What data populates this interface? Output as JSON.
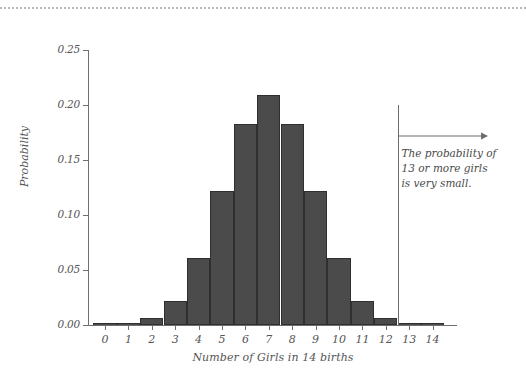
{
  "figure": {
    "top_rule": "dotted-rule"
  },
  "chart_data": {
    "type": "bar",
    "title": "",
    "subtitle": "",
    "xlabel": "Number of Girls in 14 births",
    "ylabel": "Probability",
    "categories": [
      "0",
      "1",
      "2",
      "3",
      "4",
      "5",
      "6",
      "7",
      "8",
      "9",
      "10",
      "11",
      "12",
      "13",
      "14"
    ],
    "values": [
      0.0,
      0.001,
      0.006,
      0.022,
      0.061,
      0.122,
      0.183,
      0.209,
      0.183,
      0.122,
      0.061,
      0.022,
      0.006,
      0.001,
      0.0
    ],
    "ylim": [
      0.0,
      0.25
    ],
    "xlim": [
      -0.5,
      14.5
    ],
    "ytick_labels": [
      "0.00",
      "0.05",
      "0.10",
      "0.15",
      "0.20",
      "0.25"
    ],
    "ytick_values": [
      0.0,
      0.05,
      0.1,
      0.15,
      0.2,
      0.25
    ],
    "xtick_labels": [
      "0",
      "1",
      "2",
      "3",
      "4",
      "5",
      "6",
      "7",
      "8",
      "9",
      "10",
      "11",
      "12",
      "13",
      "14"
    ],
    "grid": false,
    "legend": null,
    "bar_color": "#4b4b4b",
    "bar_edge_color": "#2f2f2f",
    "axis_color": "#6f6f6f",
    "text_color": "#555555",
    "annotations": [
      {
        "name": "probability-13-or-more",
        "lines": [
          "The probability of",
          "13 or more girls",
          "is very small."
        ],
        "vline_at_x": 12.5,
        "arrow_direction": "right"
      }
    ]
  }
}
